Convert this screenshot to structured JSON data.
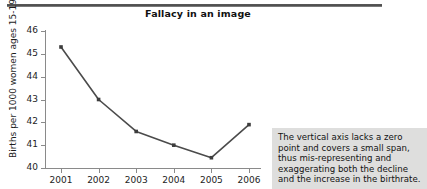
{
  "figure": {
    "title": "Fallacy in an image",
    "top_rule": "decorative-rule"
  },
  "annotation": {
    "text": "The vertical axis lacks a zero point and covers a small span, thus mis-representing and exaggerating both the decline and the increase in the birthrate.",
    "background_color": "#dededd"
  },
  "chart_data": {
    "type": "line",
    "title": "Fallacy in an image",
    "xlabel": "",
    "ylabel": "Births per 1000 women ages 15-19",
    "categories": [
      "2001",
      "2002",
      "2003",
      "2004",
      "2005",
      "2006"
    ],
    "values": [
      45.3,
      43.0,
      41.6,
      41.0,
      40.45,
      41.9
    ],
    "series": [
      {
        "name": "Births per 1000 women ages 15-19",
        "values": [
          45.3,
          43.0,
          41.6,
          41.0,
          40.45,
          41.9
        ]
      }
    ],
    "ylim": [
      40,
      46
    ],
    "yticks": [
      40,
      41,
      42,
      43,
      44,
      45,
      46
    ],
    "ytick_labels": [
      "40",
      "41",
      "42",
      "43",
      "44",
      "45",
      "46"
    ],
    "xtick_labels": [
      "2001",
      "2002",
      "2003",
      "2004",
      "2005",
      "2006"
    ],
    "grid": false,
    "legend": false,
    "legend_position": "none",
    "line_color": "#4b4b4b",
    "marker_color": "#3d3d3d",
    "marker": "square"
  }
}
